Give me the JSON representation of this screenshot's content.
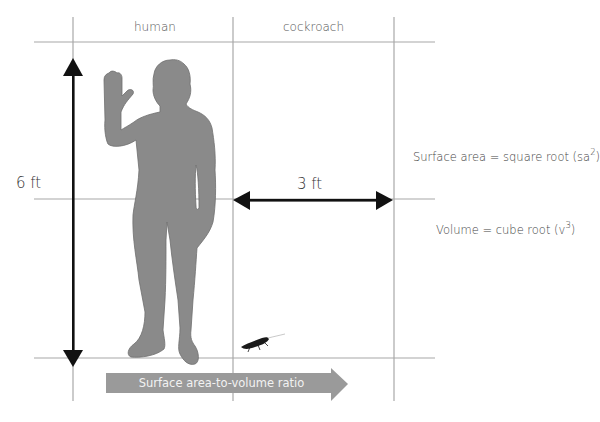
{
  "columns": {
    "human": "human",
    "cockroach": "cockroach"
  },
  "dimensions": {
    "human_height": "6 ft",
    "cockroach_width": "3 ft"
  },
  "formulas": {
    "surface_area_prefix": "Surface area = square root (sa",
    "surface_area_exponent": "2",
    "surface_area_suffix": ")",
    "volume_prefix": "Volume = cube root (v",
    "volume_exponent": "3",
    "volume_suffix": ")"
  },
  "ratio_arrow": {
    "label": "Surface area-to-volume ratio"
  },
  "figures": {
    "human": "human-silhouette",
    "cockroach": "cockroach-silhouette"
  },
  "colors": {
    "grid": "#a8a8a8",
    "silhouette": "#8a8a8a",
    "arrow_dark": "#111111",
    "ratio_arrow": "#9a9a9a"
  }
}
